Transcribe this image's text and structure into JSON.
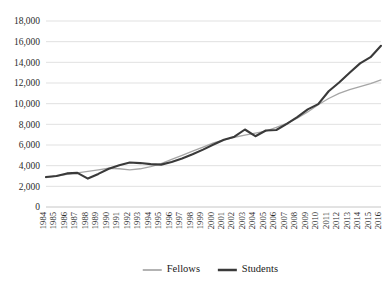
{
  "chart_data": {
    "type": "line",
    "title": "",
    "subtitle": "",
    "xlabel": "",
    "ylabel": "",
    "grid": true,
    "legend_position": "bottom",
    "ylim": [
      0,
      18000
    ],
    "ytick_step": 2000,
    "ytick_labels": [
      "0",
      "2,000",
      "4,000",
      "6,000",
      "8,000",
      "10,000",
      "12,000",
      "14,000",
      "16,000",
      "18,000"
    ],
    "ytick_values": [
      0,
      2000,
      4000,
      6000,
      8000,
      10000,
      12000,
      14000,
      16000,
      18000
    ],
    "categories": [
      "1984",
      "1985",
      "1986",
      "1987",
      "1988",
      "1989",
      "1990",
      "1991",
      "1992",
      "1993",
      "1994",
      "1995",
      "1996",
      "1997",
      "1998",
      "1999",
      "2000",
      "2001",
      "2002",
      "2003",
      "2004",
      "2005",
      "2006",
      "2007",
      "2008",
      "2009",
      "2010",
      "2011",
      "2012",
      "2013",
      "2014",
      "2015",
      "2016"
    ],
    "series": [
      {
        "name": "Fellows",
        "color": "#a6a6a6",
        "stroke_width": 1.3,
        "values": [
          2850,
          3000,
          3150,
          3300,
          3450,
          3600,
          3750,
          3700,
          3600,
          3700,
          3900,
          4200,
          4600,
          5000,
          5400,
          5800,
          6200,
          6500,
          6750,
          6950,
          7150,
          7350,
          7700,
          8100,
          8600,
          9200,
          9900,
          10500,
          11000,
          11350,
          11650,
          11950,
          12300
        ]
      },
      {
        "name": "Students",
        "color": "#3a3a3a",
        "stroke_width": 2.1,
        "values": [
          2900,
          3000,
          3250,
          3300,
          2750,
          3200,
          3700,
          4050,
          4300,
          4250,
          4150,
          4100,
          4350,
          4700,
          5100,
          5550,
          6050,
          6500,
          6800,
          7500,
          6850,
          7400,
          7450,
          8050,
          8700,
          9450,
          9950,
          11200,
          12050,
          13000,
          13900,
          14500,
          15600
        ]
      }
    ],
    "legend": [
      {
        "label": "Fellows",
        "color": "#a6a6a6",
        "stroke_width": 1.3
      },
      {
        "label": "Students",
        "color": "#3a3a3a",
        "stroke_width": 2.1
      }
    ]
  }
}
